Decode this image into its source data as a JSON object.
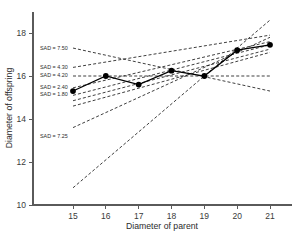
{
  "chart_data": {
    "type": "line",
    "title": "",
    "xlabel": "Diameter of parent",
    "ylabel": "Diameter of offspring",
    "xlim": [
      14.4,
      21.8
    ],
    "xticks": [
      15,
      16,
      17,
      18,
      19,
      20,
      21
    ],
    "ylim": [
      10,
      18.9
    ],
    "yticks": [
      10,
      12,
      14,
      16,
      18
    ],
    "grid": false,
    "legend": "inline-annotations",
    "observed": {
      "name": "Observed offspring diameter",
      "style": "solid line with filled circle markers",
      "x": [
        15,
        16,
        17,
        18,
        19,
        20,
        21
      ],
      "y": [
        15.3,
        16.0,
        15.6,
        16.25,
        16.0,
        17.2,
        17.45
      ]
    },
    "series": [
      {
        "name": "SAD = 7.50",
        "label": "SAD = 7.50",
        "style": "dashed",
        "x": [
          15,
          21
        ],
        "y": [
          17.3,
          15.3
        ]
      },
      {
        "name": "SAD = 4.30",
        "label": "SAD = 4.30",
        "style": "dashed",
        "x": [
          15,
          21
        ],
        "y": [
          16.4,
          17.9
        ]
      },
      {
        "name": "SAD = 4.20",
        "label": "SAD = 4.20",
        "style": "dashed",
        "x": [
          15,
          21
        ],
        "y": [
          16.0,
          16.0
        ]
      },
      {
        "name": "SAD = 2.40",
        "label": "SAD = 2.40",
        "style": "dashed",
        "x": [
          15,
          21
        ],
        "y": [
          15.45,
          17.6
        ]
      },
      {
        "name": "SAD = 1.80",
        "label": "SAD = 1.80",
        "style": "dashed",
        "x": [
          15,
          21
        ],
        "y": [
          15.1,
          17.45
        ]
      },
      {
        "name": "SAD = 7.25",
        "label": "SAD = 7.25",
        "style": "dashed",
        "x": [
          15,
          21
        ],
        "y": [
          10.8,
          18.6
        ]
      },
      {
        "name": "steep-dashed-a",
        "label": "",
        "style": "dashed",
        "x": [
          15,
          21
        ],
        "y": [
          13.6,
          17.8
        ]
      },
      {
        "name": "steep-dashed-b",
        "label": "",
        "style": "dashed",
        "x": [
          15,
          21
        ],
        "y": [
          14.6,
          17.1
        ]
      },
      {
        "name": "steep-dashed-c",
        "label": "",
        "style": "dashed",
        "x": [
          15,
          21
        ],
        "y": [
          14.85,
          17.25
        ]
      }
    ],
    "annotations": [
      {
        "text": "SAD = 7.50",
        "x": 15.0,
        "y": 17.32
      },
      {
        "text": "SAD = 4.30",
        "x": 15.0,
        "y": 16.42
      },
      {
        "text": "SAD = 4.20",
        "x": 15.0,
        "y": 16.04
      },
      {
        "text": "SAD = 2.40",
        "x": 15.0,
        "y": 15.48
      },
      {
        "text": "SAD = 1.80",
        "x": 15.0,
        "y": 15.16
      },
      {
        "text": "SAD = 7.25",
        "x": 15.0,
        "y": 13.22
      }
    ],
    "colors": {
      "line": "#000000",
      "axis": "#5a5a5a",
      "text": "#2b2b2b",
      "background": "#ffffff"
    }
  }
}
